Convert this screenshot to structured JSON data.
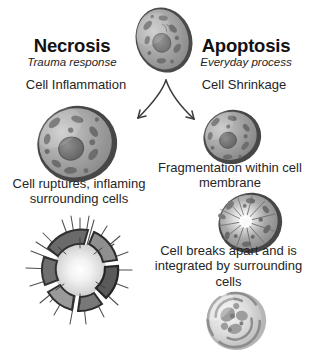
{
  "diagram": {
    "title_left": "Necrosis",
    "title_right": "Apoptosis",
    "subtitle_left": "Trauma response",
    "subtitle_right": "Everyday process",
    "necrosis_path": {
      "step1": "Cell Inflammation",
      "step2_line1": "Cell ruptures, inflaming",
      "step2_line2": "surrounding cells"
    },
    "apoptosis_path": {
      "step1": "Cell Shrinkage",
      "step2_line1": "Fragmentation within cell",
      "step2_line2": "membrane",
      "step3_line1": "Cell breaks apart and is",
      "step3_line2": "integrated by surrounding cells"
    },
    "figures": {
      "origin": "healthy-cell",
      "necrotic": "swollen-cell",
      "burst": "ruptured-cell",
      "shrunk": "shrunken-cell",
      "fragmenting": "fragmenting-cell",
      "engulfed": "engulfed-apoptotic-body"
    },
    "colors": {
      "cytoplasm": "#a3a3a3",
      "cytoplasm_light": "#c2c2c2",
      "membrane": "#4a4a4a",
      "organelle": "#6e6e6e",
      "nucleus": "#777777",
      "text": "#1c1c1c",
      "arrow": "#3c3c3c",
      "background": "#ffffff"
    }
  }
}
